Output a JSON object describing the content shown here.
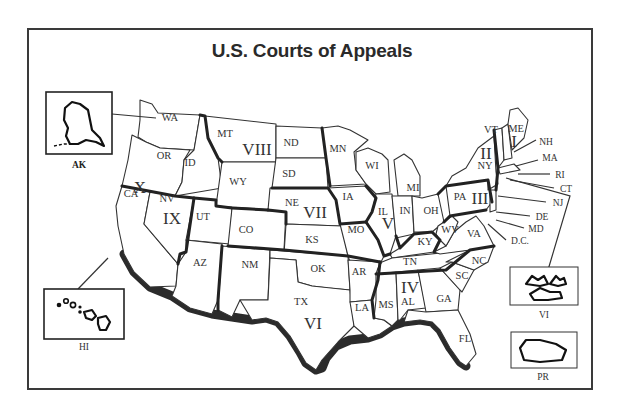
{
  "title": "U.S. Courts of Appeals",
  "states": {
    "WA": "WA",
    "OR": "OR",
    "ID": "ID",
    "CA": "CA",
    "NV": "NV",
    "MT": "MT",
    "WY": "WY",
    "UT": "UT",
    "CO": "CO",
    "AZ": "AZ",
    "NM": "NM",
    "ND": "ND",
    "SD": "SD",
    "NE": "NE",
    "KS": "KS",
    "OK": "OK",
    "TX": "TX",
    "MN": "MN",
    "IA": "IA",
    "MO": "MO",
    "AR": "AR",
    "LA": "LA",
    "WI": "WI",
    "IL": "IL",
    "MI": "MI",
    "IN": "IN",
    "OH": "OH",
    "KY": "KY",
    "TN": "TN",
    "MS": "MS",
    "AL": "AL",
    "GA": "GA",
    "FL": "FL",
    "SC": "SC",
    "NC": "NC",
    "VA": "VA",
    "WV": "WV",
    "PA": "PA",
    "NY": "NY",
    "VT": "VT",
    "ME": "ME"
  },
  "callouts": {
    "NH": "NH",
    "MA": "MA",
    "RI": "RI",
    "CT": "CT",
    "NJ": "NJ",
    "DE": "DE",
    "MD": "MD",
    "DC": "D.C."
  },
  "circuits": {
    "I": "I",
    "II": "II",
    "III": "III",
    "IV": "IV",
    "V": "V",
    "VI_tx": "VI",
    "VII": "VII",
    "VIII": "VIII",
    "IX": "IX",
    "X": "X"
  },
  "insets": {
    "alaska": "AK",
    "hawaii": "HI",
    "virgin_islands": "VI",
    "puerto_rico": "PR"
  }
}
